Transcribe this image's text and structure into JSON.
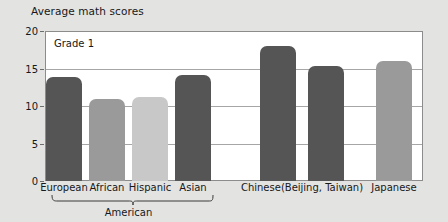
{
  "chart_data": {
    "type": "bar",
    "title": "Average math scores",
    "xlabel": "",
    "ylabel": "",
    "ylim": [
      0,
      20
    ],
    "yticks": [
      0,
      5,
      10,
      15,
      20
    ],
    "grid": true,
    "legend": "none",
    "annotation": "Grade 1",
    "categories": [
      "European",
      "African",
      "Hispanic",
      "Asian",
      "Chinese",
      "Chinese",
      "Japanese"
    ],
    "values": [
      13.9,
      11.0,
      11.2,
      14.1,
      18.0,
      15.3,
      16.0
    ],
    "bars": [
      {
        "label": "European",
        "value": 13.9,
        "color": "#555555",
        "group": "American"
      },
      {
        "label": "African",
        "value": 11.0,
        "color": "#9a9a9a",
        "group": "American"
      },
      {
        "label": "Hispanic",
        "value": 11.2,
        "color": "#c8c8c8",
        "group": "American"
      },
      {
        "label": "Asian",
        "value": 14.1,
        "color": "#555555",
        "group": "American"
      },
      {
        "label": "Chinese",
        "value": 18.0,
        "color": "#555555",
        "group": "Chinese (Beijing, Taiwan)"
      },
      {
        "label": "Chinese",
        "value": 15.3,
        "color": "#555555",
        "group": "Chinese (Beijing, Taiwan)"
      },
      {
        "label": "Japanese",
        "value": 16.0,
        "color": "#9a9a9a",
        "group": "Japanese"
      }
    ],
    "group_labels": [
      {
        "text": "American",
        "covers": [
          "European",
          "African",
          "Hispanic",
          "Asian"
        ]
      },
      {
        "text": "Chinese",
        "text2": "(Beijing, Taiwan)",
        "covers": [
          "Chinese",
          "Chinese"
        ]
      },
      {
        "text": "Japanese",
        "covers": [
          "Japanese"
        ]
      }
    ],
    "colors": {
      "bar_dark": "#555555",
      "bar_medium": "#9a9a9a",
      "bar_light": "#c8c8c8",
      "plot_background": "#ffffff",
      "page_background": "#e3e3e1",
      "grid": "#a6a6a6",
      "frame": "#8c8c8c",
      "text": "#16181a"
    }
  }
}
